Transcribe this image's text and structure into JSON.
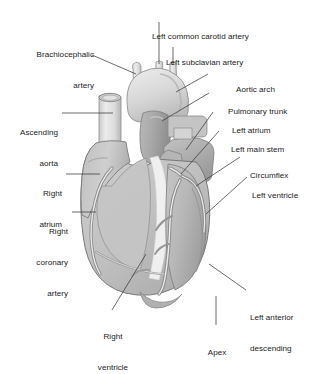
{
  "figure": {
    "background_color": "#ffffff",
    "text_color": "#1b1b1b",
    "leader_line_color": "#3a3a3a",
    "style": "grayscale medical illustration",
    "width": 318,
    "height": 354
  },
  "palette": {
    "myocardium_light": "#d2d2d2",
    "myocardium_mid": "#bdbdbd",
    "myocardium_dark": "#a6a6a6",
    "aorta_light": "#e3e3e3",
    "vessel_gray": "#b4b4b4",
    "fat_white": "#f4f4f4",
    "outline": "#6e6e6e",
    "artery_stroke": "#8c8c8c"
  },
  "labels": {
    "brachiocephalic_artery": {
      "lines": [
        "Brachiocephalic",
        "artery"
      ],
      "align": "right"
    },
    "left_common_carotid_artery": {
      "lines": [
        "Left common carotid artery"
      ],
      "align": "left"
    },
    "left_subclavian_artery": {
      "lines": [
        "Left subclavian artery"
      ],
      "align": "left"
    },
    "aortic_arch": {
      "lines": [
        "Aortic arch"
      ],
      "align": "left"
    },
    "pulmonary_trunk": {
      "lines": [
        "Pulmonary trunk"
      ],
      "align": "left"
    },
    "left_atrium": {
      "lines": [
        "Left atrium"
      ],
      "align": "left"
    },
    "left_main_stem": {
      "lines": [
        "Left main stem"
      ],
      "align": "left"
    },
    "circumflex": {
      "lines": [
        "Circumflex"
      ],
      "align": "left"
    },
    "left_ventricle": {
      "lines": [
        "Left ventricle"
      ],
      "align": "left"
    },
    "left_anterior_descending": {
      "lines": [
        "Left anterior",
        "descending"
      ],
      "align": "left"
    },
    "apex": {
      "lines": [
        "Apex"
      ],
      "align": "center"
    },
    "right_ventricle": {
      "lines": [
        "Right",
        "ventricle"
      ],
      "align": "center"
    },
    "right_coronary_artery": {
      "lines": [
        "Right",
        "coronary",
        "artery"
      ],
      "align": "right"
    },
    "right_atrium": {
      "lines": [
        "Right",
        "atrium"
      ],
      "align": "right"
    },
    "ascending_aorta": {
      "lines": [
        "Ascending",
        "aorta"
      ],
      "align": "right"
    }
  }
}
